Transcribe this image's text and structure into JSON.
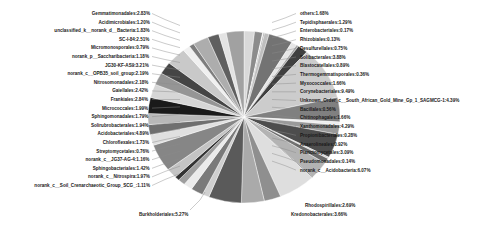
{
  "figure": {
    "kind": "pie-chart",
    "background": "#ffffff",
    "label_color": "#1a1a1a"
  },
  "chart_data": {
    "type": "pie",
    "title": "",
    "subtitle": "",
    "xlabel": "",
    "ylabel": "",
    "legend_position": "none",
    "grid": false,
    "value_unit": "%",
    "label_format": "name:value%",
    "categories": [
      "others",
      "Tepidisphaerales",
      "Enterobacteriales",
      "Rhizobiales",
      "Desulfurellales",
      "Solibacterales",
      "Blastocatellales",
      "Thermogemmatisporales",
      "Myxococcales",
      "Corynebacteriales",
      "Unknown_Order_c__South_African_Gold_Mine_Gp_1_SAGMCG-1",
      "Bacillales",
      "Chitinophagales",
      "Xanthomonadales",
      "Propionibacteriales",
      "Anaerolineales",
      "Planctomycetales",
      "Pseudomonadales",
      "norank_c__Acidobacteria",
      "Rhodospirillales",
      "Kredonobacterales",
      "Burkholderiales",
      "norank_c__Soil_Crenarchaeotic_Group_SCG_",
      "norank_c__Nitrospira",
      "Sphingobacteriales",
      "norank_c__JG37-AG-4",
      "Streptomycetales",
      "Chloroflexales",
      "Acidobacteriales",
      "Solirubrobacterales",
      "Sphingomonadales",
      "Micrococcales",
      "Frankiales",
      "Gaiellales",
      "Nitrosomonadales",
      "norank_c__OPB35_soil_group",
      "JG30-KF-AS9",
      "norank_p__Saccharibacteria",
      "Micromonosporales",
      "SC-I-84",
      "unclassified_k__norank_d__Bacteria",
      "Acidimicrobiales",
      "Gemmatimonadales"
    ],
    "values": [
      1.68,
      1.29,
      0.17,
      0.13,
      0.75,
      3.88,
      0.89,
      0.36,
      1.66,
      9.49,
      4.39,
      0.56,
      1.66,
      4.29,
      0.28,
      0.92,
      3.09,
      0.14,
      6.07,
      2.69,
      3.66,
      5.27,
      1.11,
      1.97,
      1.42,
      1.16,
      0.76,
      1.73,
      4.89,
      1.94,
      1.79,
      1.99,
      2.84,
      2.42,
      2.18,
      2.19,
      3.21,
      1.18,
      0.79,
      2.51,
      1.83,
      1.2,
      2.83
    ],
    "slice_labels": [
      "others:1.68%",
      "Tepidisphaerales:1.29%",
      "Enterobacteriales:0.17%",
      "Rhizobiales:0.13%",
      "Desulfurellales:0.75%",
      "Solibacterales:3.88%",
      "Blastocatellales:0.89%",
      "Thermogemmatisporales:0.36%",
      "Myxococcales:1.66%",
      "Corynebacteriales:9.49%",
      "Unknown_Order_c__South_African_Gold_Mine_Gp_1_SAGMCG-1:4.39%",
      "Bacillales:0.56%",
      "Chitinophagales:1.66%",
      "Xanthomonadales:4.29%",
      "Propionibacteriales:0.28%",
      "Anaerolineales:0.92%",
      "Planctomycetales:3.09%",
      "Pseudomonadales:0.14%",
      "norank_c__Acidobacteria:6.07%",
      "Rhodospirillales:2.69%",
      "Kredonobacterales:3.66%",
      "Burkholderiales:5.27%",
      "norank_c__Soil_Crenarchaeotic_Group_SCG_:1.11%",
      "norank_c__Nitrospira:1.97%",
      "Sphingobacteriales:1.42%",
      "norank_c__JG37-AG-4:1.16%",
      "Streptomycetales:0.76%",
      "Chloroflexales:1.73%",
      "Acidobacteriales:4.89%",
      "Solirubrobacterales:1.94%",
      "Sphingomonadales:1.79%",
      "Micrococcales:1.99%",
      "Frankiales:2.84%",
      "Gaiellales:2.42%",
      "Nitrosomonadales:2.18%",
      "norank_c__OPB35_soil_group:2.19%",
      "JG30-KF-AS9:3.21%",
      "norank_p__Saccharibacteria:1.18%",
      "Micromonosporales:0.79%",
      "SC-I-84:2.51%",
      "unclassified_k__norank_d__Bacteria:1.83%",
      "Acidimicrobiales:1.20%",
      "Gemmatimonadales:2.83%"
    ],
    "colors": [
      "#d9d9d9",
      "#8c8c8c",
      "#f2f2f2",
      "#595959",
      "#bfbfbf",
      "#737373",
      "#e6e6e6",
      "#a6a6a6",
      "#404040",
      "#cccccc",
      "#808080",
      "#ededed",
      "#9a9a9a",
      "#4d4d4d",
      "#d2d2d2",
      "#6b6b6b",
      "#b3b3b3",
      "#262626",
      "#dedede",
      "#8f8f8f",
      "#aaaaaa",
      "#5a5a5a",
      "#cfcfcf",
      "#7a7a7a",
      "#ebebeb",
      "#9e9e9e",
      "#333333",
      "#c4c4c4",
      "#868686",
      "#e0e0e0",
      "#6f6f6f",
      "#b8b8b8",
      "#1a1a1a",
      "#d6d6d6",
      "#959595",
      "#454545",
      "#c9c9c9",
      "#f0f0f0",
      "#7e7e7e",
      "#adadad",
      "#5f5f5f",
      "#e3e3e3",
      "#a1a1a1"
    ]
  },
  "labels_left": [
    {
      "text": "Gemmatimonadales:2.83%"
    },
    {
      "text": "Acidimicrobiales:1.20%"
    },
    {
      "text": "unclassified_k__norank_d__Bacteria:1.83%"
    },
    {
      "text": "SC-I-84:2.51%"
    },
    {
      "text": "Micromonosporales:0.79%"
    },
    {
      "text": "norank_p__Saccharibacteria:1.18%"
    },
    {
      "text": "JG30-KF-AS9:3.21%"
    },
    {
      "text": "norank_c__OPB35_soil_group:2.19%"
    },
    {
      "text": "Nitrosomonadales:2.18%"
    },
    {
      "text": "Gaiellales:2.42%"
    },
    {
      "text": "Frankiales:2.84%"
    },
    {
      "text": "Micrococcales:1.99%"
    },
    {
      "text": "Sphingomonadales:1.79%"
    },
    {
      "text": "Solirubrobacterales:1.94%"
    },
    {
      "text": "Acidobacteriales:4.89%"
    },
    {
      "text": "Chloroflexales:1.73%"
    },
    {
      "text": "Streptomycetales:0.76%"
    },
    {
      "text": "norank_c__JG37-AG-4:1.16%"
    },
    {
      "text": "Sphingobacteriales:1.42%"
    },
    {
      "text": "norank_c__Nitrospira:1.97%"
    },
    {
      "text": "norank_c__Soil_Crenarchaeotic_Group_SCG_:1.11%"
    }
  ],
  "labels_right": [
    {
      "text": "others:1.68%"
    },
    {
      "text": "Tepidisphaerales:1.29%"
    },
    {
      "text": "Enterobacteriales:0.17%"
    },
    {
      "text": "Rhizobiales:0.13%"
    },
    {
      "text": "Desulfurellales:0.75%"
    },
    {
      "text": "Solibacterales:3.88%"
    },
    {
      "text": "Blastocatellales:0.89%"
    },
    {
      "text": "Thermogemmatisporales:0.36%"
    },
    {
      "text": "Myxococcales:1.66%"
    },
    {
      "text": "Corynebacteriales:9.49%"
    },
    {
      "text": "Unknown_Order_c__South_African_Gold_Mine_Gp_1_SAGMCG-1:4.39%"
    },
    {
      "text": "Bacillales:0.56%"
    },
    {
      "text": "Chitinophagales:1.66%"
    },
    {
      "text": "Xanthomonadales:4.29%"
    },
    {
      "text": "Propionibacteriales:0.28%"
    },
    {
      "text": "Anaerolineales:0.92%"
    },
    {
      "text": "Planctomycetales:3.09%"
    },
    {
      "text": "Pseudomonadales:0.14%"
    },
    {
      "text": "norank_c__Acidobacteria:6.07%"
    }
  ],
  "labels_bottom": [
    {
      "text": "Burkholderiales:5.27%"
    },
    {
      "text": "Rhodospirillales:2.69%"
    },
    {
      "text": "Kredonobacterales:3.66%"
    }
  ]
}
